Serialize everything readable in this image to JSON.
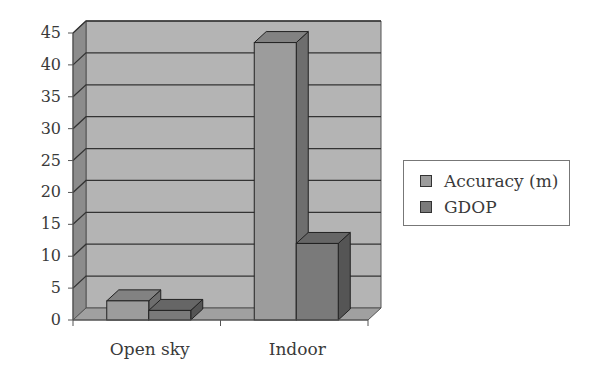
{
  "chart_data": {
    "type": "bar",
    "style": "3d-clustered-column",
    "title": "",
    "xlabel": "",
    "ylabel": "",
    "categories": [
      "Open sky",
      "Indoor"
    ],
    "series": [
      {
        "name": "Accuracy (m)",
        "values": [
          3,
          43.5
        ],
        "color": "#9c9c9c",
        "side_color": "#6e6e6e",
        "top_color": "#828282"
      },
      {
        "name": "GDOP",
        "values": [
          1.5,
          12
        ],
        "color": "#7a7a7a",
        "side_color": "#555555",
        "top_color": "#666666"
      }
    ],
    "ylim": [
      0,
      45
    ],
    "yticks": [
      0,
      5,
      10,
      15,
      20,
      25,
      30,
      35,
      40,
      45
    ],
    "grid": true,
    "legend_position": "right",
    "back_wall_color": "#b4b4b4",
    "side_wall_color": "#8c8c8c",
    "floor_color": "#a0a0a0"
  },
  "legend": {
    "items": [
      {
        "label": "Accuracy (m)",
        "color": "#9c9c9c"
      },
      {
        "label": "GDOP",
        "color": "#7a7a7a"
      }
    ]
  }
}
